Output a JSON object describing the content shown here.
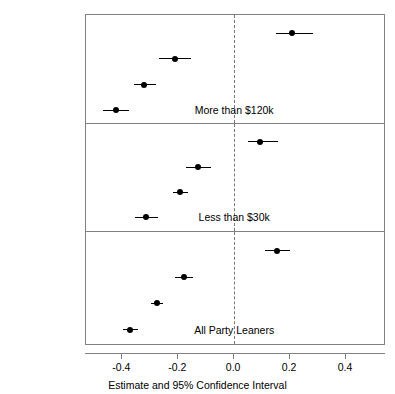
{
  "chart_data": {
    "type": "scatter",
    "title": "",
    "xlabel": "Estimate and 95% Confidence Interval",
    "ylabel": "",
    "xlim": [
      -0.53,
      0.543
    ],
    "xticks": [
      -0.4,
      -0.2,
      0.0,
      0.2,
      0.4
    ],
    "xtick_labels": [
      "-0.4",
      "-0.2",
      "0.0",
      "0.2",
      "0.4"
    ],
    "grid": false,
    "legend": "none",
    "reference_line": 0.0,
    "reference_line_style": "dashed",
    "categories": [
      "JustParty",
      "JustRep",
      "Both",
      "MisalignedPty"
    ],
    "panels": [
      {
        "label": "More than $120k",
        "label_x": 0.0,
        "points": [
          {
            "category": "JustParty",
            "estimate": 0.207,
            "ci_low": 0.15,
            "ci_high": 0.282
          },
          {
            "category": "JustRep",
            "estimate": -0.21,
            "ci_low": -0.268,
            "ci_high": -0.154
          },
          {
            "category": "Both",
            "estimate": -0.321,
            "ci_low": -0.357,
            "ci_high": -0.279
          },
          {
            "category": "MisalignedPty",
            "estimate": -0.421,
            "ci_low": -0.468,
            "ci_high": -0.375
          }
        ]
      },
      {
        "label": "Less than $30k",
        "label_x": 0.0,
        "points": [
          {
            "category": "JustParty",
            "estimate": 0.093,
            "ci_low": 0.05,
            "ci_high": 0.157
          },
          {
            "category": "JustRep",
            "estimate": -0.129,
            "ci_low": -0.171,
            "ci_high": -0.082
          },
          {
            "category": "Both",
            "estimate": -0.193,
            "ci_low": -0.218,
            "ci_high": -0.164
          },
          {
            "category": "MisalignedPty",
            "estimate": -0.314,
            "ci_low": -0.354,
            "ci_high": -0.271
          }
        ]
      },
      {
        "label": "All Party Leaners",
        "label_x": 0.0,
        "points": [
          {
            "category": "JustParty",
            "estimate": 0.154,
            "ci_low": 0.111,
            "ci_high": 0.2
          },
          {
            "category": "JustRep",
            "estimate": -0.179,
            "ci_low": -0.211,
            "ci_high": -0.146
          },
          {
            "category": "Both",
            "estimate": -0.275,
            "ci_low": -0.296,
            "ci_high": -0.254
          },
          {
            "category": "MisalignedPty",
            "estimate": -0.371,
            "ci_low": -0.396,
            "ci_high": -0.343
          }
        ]
      }
    ]
  },
  "colors": {
    "point": "#000000",
    "interval": "#000000",
    "panel_border": "#808080",
    "reference_line": "#777777",
    "background": "#ffffff"
  }
}
